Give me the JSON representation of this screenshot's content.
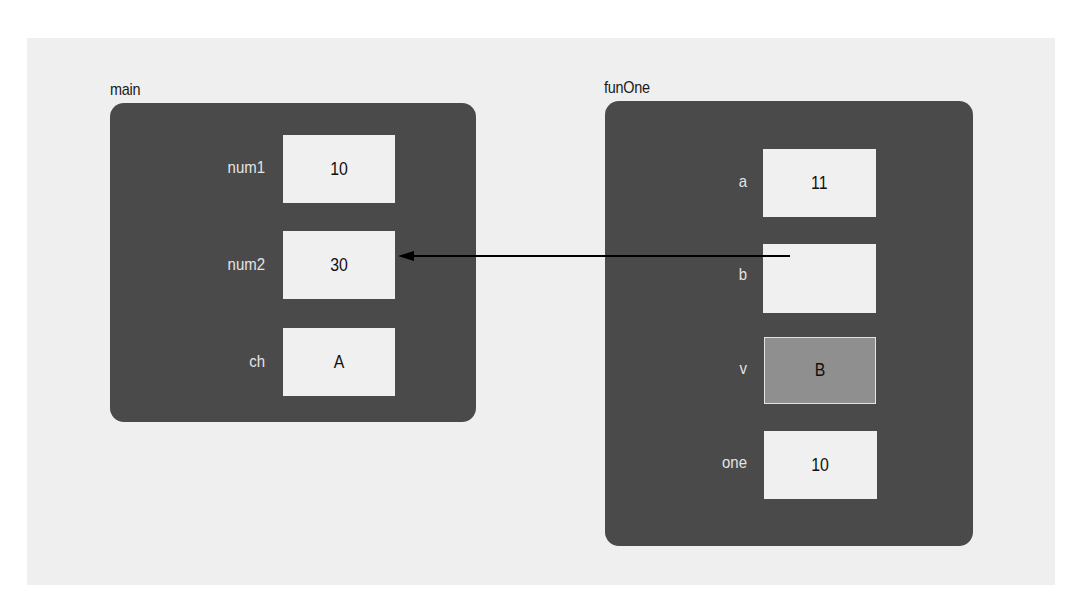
{
  "diagram": {
    "frames": [
      {
        "id": "main",
        "title": "main",
        "variables": [
          {
            "name": "num1",
            "value": "10"
          },
          {
            "name": "num2",
            "value": "30"
          },
          {
            "name": "ch",
            "value": "A"
          }
        ]
      },
      {
        "id": "funOne",
        "title": "funOne",
        "variables": [
          {
            "name": "a",
            "value": "11"
          },
          {
            "name": "b",
            "value": ""
          },
          {
            "name": "v",
            "value": "B"
          },
          {
            "name": "one",
            "value": "10"
          }
        ]
      }
    ],
    "arrows": [
      {
        "from": "funOne.b",
        "to": "main.num2",
        "meaning": "reference parameter"
      }
    ],
    "colors": {
      "frame": "#4a4a4a",
      "cell": "#f0f0f0",
      "highlighted_cell": "#8f8f8f",
      "backdrop": "#efefef",
      "arrow": "#000000"
    }
  }
}
